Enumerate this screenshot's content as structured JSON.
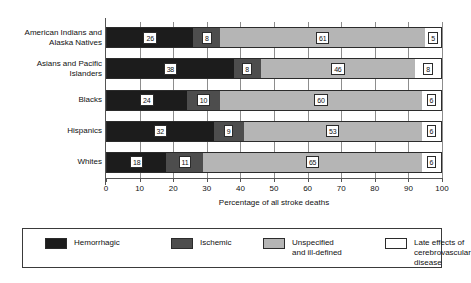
{
  "chart_data": {
    "type": "bar",
    "orientation": "horizontal",
    "stacked": true,
    "title": "",
    "xlabel": "Percentage of all stroke deaths",
    "ylabel": "",
    "xlim": [
      0,
      100
    ],
    "xticks": [
      0,
      10,
      20,
      30,
      40,
      50,
      60,
      70,
      80,
      90,
      100
    ],
    "grid": true,
    "legend_position": "bottom",
    "categories": [
      "American Indians and\nAlaska Natives",
      "Asians and Pacific\nIslanders",
      "Blacks",
      "Hispanics",
      "Whites"
    ],
    "series": [
      {
        "name": "Hemorrhagic",
        "color": "#1c1c1c",
        "values": [
          26,
          38,
          24,
          32,
          18
        ]
      },
      {
        "name": "Ischemic",
        "color": "#4d4d4d",
        "values": [
          8,
          8,
          10,
          9,
          11
        ]
      },
      {
        "name": "Unspecified\nand ill-defined",
        "color": "#b5b5b5",
        "values": [
          61,
          46,
          60,
          53,
          65
        ]
      },
      {
        "name": "Late effects of cerebrovascular\ndisease",
        "color": "#ffffff",
        "values": [
          5,
          8,
          6,
          6,
          6
        ]
      }
    ]
  },
  "legend": {
    "items": [
      {
        "label": "Hemorrhagic",
        "swatch": "hemorrhagic"
      },
      {
        "label": "Ischemic",
        "swatch": "ischemic"
      },
      {
        "label": "Unspecified\nand ill-defined",
        "swatch": "unspecified"
      },
      {
        "label": "Late effects of cerebrovascular\ndisease",
        "swatch": "late"
      }
    ]
  },
  "axis": {
    "x_title": "Percentage of all stroke deaths",
    "tick_labels": [
      "0",
      "10",
      "20",
      "30",
      "40",
      "50",
      "60",
      "70",
      "80",
      "90",
      "100"
    ]
  }
}
